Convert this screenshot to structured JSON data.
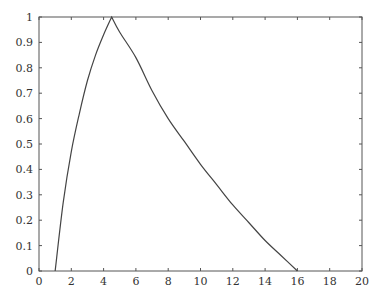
{
  "chart_data": {
    "type": "line",
    "title": "",
    "xlabel": "",
    "ylabel": "",
    "xlim": [
      0,
      20
    ],
    "ylim": [
      0,
      1
    ],
    "grid": false,
    "legend": null,
    "x_ticks": [
      0,
      2,
      4,
      6,
      8,
      10,
      12,
      14,
      16,
      18,
      20
    ],
    "x_tick_labels": [
      "0",
      "2",
      "4",
      "6",
      "8",
      "10",
      "12",
      "14",
      "16",
      "18",
      "20"
    ],
    "y_ticks": [
      0,
      0.1,
      0.2,
      0.3,
      0.4,
      0.5,
      0.6,
      0.7,
      0.8,
      0.9,
      1
    ],
    "y_tick_labels": [
      "0",
      "0.1",
      "0.2",
      "0.3",
      "0.4",
      "0.5",
      "0.6",
      "0.7",
      "0.8",
      "0.9",
      "1"
    ],
    "series": [
      {
        "name": "membership",
        "color": "#444444",
        "x": [
          1.0,
          1.5,
          2.0,
          2.5,
          3.0,
          3.5,
          4.0,
          4.5,
          5.0,
          6.0,
          7.0,
          8.0,
          9.0,
          10.0,
          11.0,
          12.0,
          13.0,
          14.0,
          15.0,
          16.0
        ],
        "y": [
          0.0,
          0.27,
          0.47,
          0.62,
          0.75,
          0.85,
          0.93,
          1.0,
          0.94,
          0.84,
          0.71,
          0.6,
          0.51,
          0.42,
          0.34,
          0.26,
          0.19,
          0.12,
          0.06,
          0.0
        ]
      }
    ]
  }
}
